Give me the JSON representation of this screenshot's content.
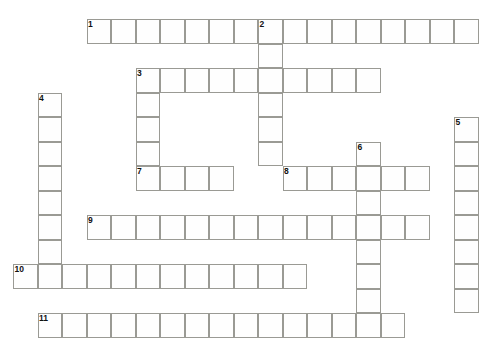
{
  "puzzle": {
    "title": "Crossword Puzzle Grid",
    "background_color": "#ffffff",
    "cell_fill_color": "#fefefe",
    "cell_border_color": "#9a9a94",
    "number_color": "#111111",
    "cell_size": 24.5,
    "origin_x": 13,
    "origin_y": 19,
    "columns": 20,
    "rows": 14,
    "entries": [
      {
        "number": "1",
        "direction": "across",
        "row": 1,
        "col": 3,
        "length": 16,
        "letters": [
          "",
          "",
          "",
          "",
          "",
          "",
          "",
          "",
          "",
          "",
          "",
          "",
          "",
          "",
          "",
          ""
        ]
      },
      {
        "number": "2",
        "direction": "down",
        "row": 1,
        "col": 10,
        "length": 6,
        "letters": [
          "",
          "",
          "",
          "",
          "",
          ""
        ]
      },
      {
        "number": "3",
        "direction": "across",
        "row": 3,
        "col": 5,
        "length": 10,
        "letters": [
          "",
          "",
          "",
          "",
          "",
          "",
          "",
          "",
          "",
          ""
        ]
      },
      {
        "number": "3",
        "direction": "down",
        "row": 3,
        "col": 5,
        "length": 5,
        "letters": [
          "",
          "",
          "",
          "",
          ""
        ]
      },
      {
        "number": "4",
        "direction": "down",
        "row": 4,
        "col": 1,
        "length": 8,
        "letters": [
          "",
          "",
          "",
          "",
          "",
          "",
          "",
          ""
        ]
      },
      {
        "number": "5",
        "direction": "down",
        "row": 5,
        "col": 18,
        "length": 8,
        "letters": [
          "",
          "",
          "",
          "",
          "",
          "",
          "",
          ""
        ]
      },
      {
        "number": "6",
        "direction": "down",
        "row": 6,
        "col": 14,
        "length": 8,
        "letters": [
          "",
          "",
          "",
          "",
          "",
          "",
          "",
          ""
        ]
      },
      {
        "number": "7",
        "direction": "across",
        "row": 7,
        "col": 5,
        "length": 4,
        "letters": [
          "",
          "",
          "",
          ""
        ]
      },
      {
        "number": "8",
        "direction": "across",
        "row": 7,
        "col": 11,
        "length": 6,
        "letters": [
          "",
          "",
          "",
          "",
          "",
          ""
        ]
      },
      {
        "number": "9",
        "direction": "across",
        "row": 9,
        "col": 3,
        "length": 14,
        "letters": [
          "",
          "",
          "",
          "",
          "",
          "",
          "",
          "",
          "",
          "",
          "",
          "",
          "",
          ""
        ]
      },
      {
        "number": "10",
        "direction": "across",
        "row": 11,
        "col": 0,
        "length": 12,
        "letters": [
          "",
          "",
          "",
          "",
          "",
          "",
          "",
          "",
          "",
          "",
          "",
          ""
        ]
      },
      {
        "number": "11",
        "direction": "across",
        "row": 13,
        "col": 1,
        "length": 15,
        "letters": [
          "",
          "",
          "",
          "",
          "",
          "",
          "",
          "",
          "",
          "",
          "",
          "",
          "",
          "",
          ""
        ]
      }
    ]
  }
}
